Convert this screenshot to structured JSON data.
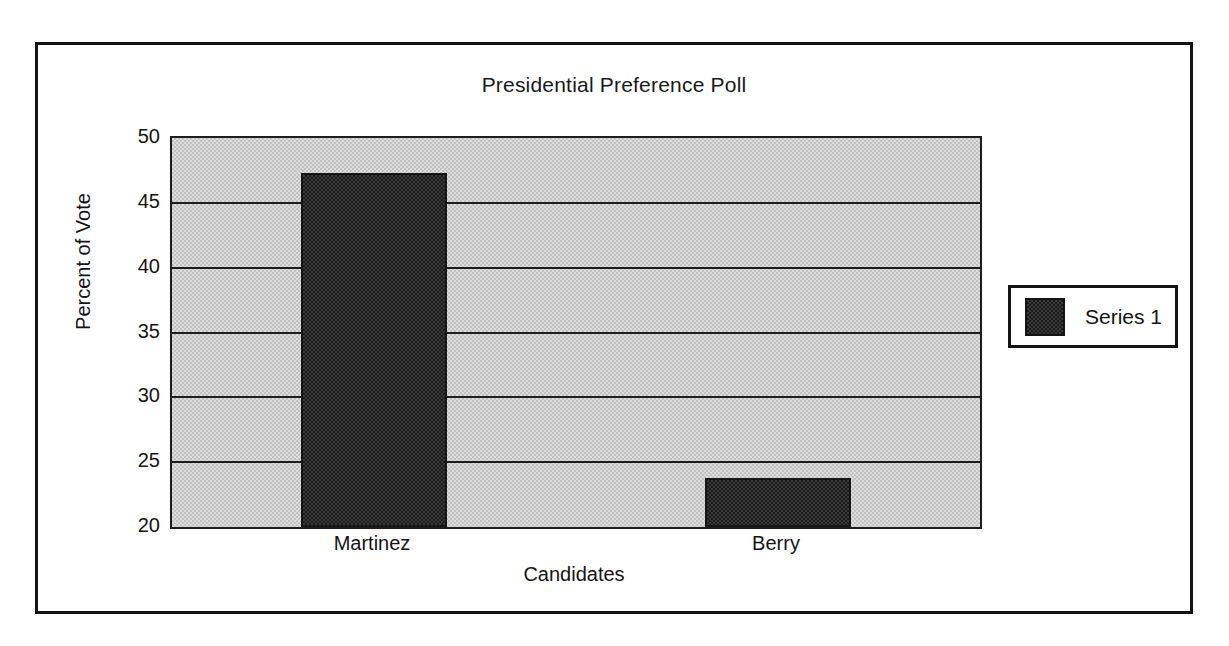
{
  "chart_data": {
    "type": "bar",
    "title": "Presidential Preference Poll",
    "xlabel": "Candidates",
    "ylabel": "Percent of Vote",
    "categories": [
      "Martinez",
      "Berry"
    ],
    "series": [
      {
        "name": "Series 1",
        "values": [
          47.3,
          23.8
        ]
      }
    ],
    "ylim": [
      20,
      50
    ],
    "ytick_step": 5,
    "yticks": [
      "50",
      "45",
      "40",
      "35",
      "30",
      "25",
      "20"
    ],
    "grid": true,
    "legend_position": "right",
    "colors": {
      "bar_fill": "#3a3a3a",
      "bar_pattern": "#1b1b1b",
      "plot_background": "#dcdcdc",
      "plot_pattern": "#c2c2c2",
      "axis_line": "#1d1d1d",
      "frame_border": "#141414",
      "text": "#141414"
    }
  },
  "legend": {
    "entries": [
      {
        "label": "Series 1"
      }
    ]
  }
}
